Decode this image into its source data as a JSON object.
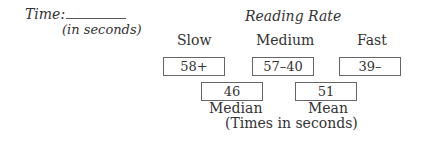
{
  "time_field": {
    "label": "Time:",
    "unit_note": "(in seconds)",
    "value": ""
  },
  "reading_rate": {
    "title": "Reading Rate",
    "categories": [
      {
        "label": "Slow",
        "value": "58+"
      },
      {
        "label": "Medium",
        "value": "57–40"
      },
      {
        "label": "Fast",
        "value": "39–"
      }
    ]
  },
  "stats": {
    "median": {
      "label": "Median",
      "value": "46"
    },
    "mean": {
      "label": "Mean",
      "value": "51"
    },
    "unit_note": "(Times in seconds)"
  }
}
